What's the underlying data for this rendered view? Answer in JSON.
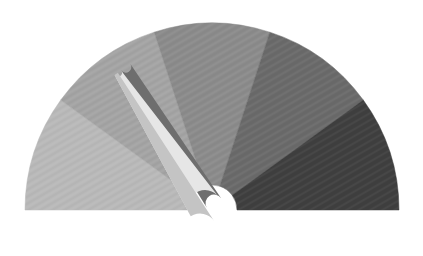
{
  "gauge": {
    "center": [
      212,
      210
    ],
    "outer_radius": 187,
    "inner_radius": 25,
    "corner_radius": 6,
    "segments": [
      {
        "name": "segment-1",
        "color": "#b9b9b9",
        "from_deg": 180,
        "to_deg": 144
      },
      {
        "name": "segment-2",
        "color": "#a4a4a4",
        "from_deg": 144,
        "to_deg": 108
      },
      {
        "name": "segment-3",
        "color": "#8b8b8b",
        "from_deg": 108,
        "to_deg": 72
      },
      {
        "name": "segment-4",
        "color": "#6a6a6a",
        "from_deg": 72,
        "to_deg": 36
      },
      {
        "name": "segment-5",
        "color": "#3f3f3f",
        "from_deg": 36,
        "to_deg": 0
      }
    ],
    "needle": {
      "angle_deg": 123,
      "length": 160,
      "base_width": 34,
      "tip_width": 8,
      "light_color": "#e6e6e6",
      "mid_color": "#c4c4c4",
      "shadow_color": "#6e6e6e",
      "base_center": [
        205,
        207
      ]
    }
  }
}
